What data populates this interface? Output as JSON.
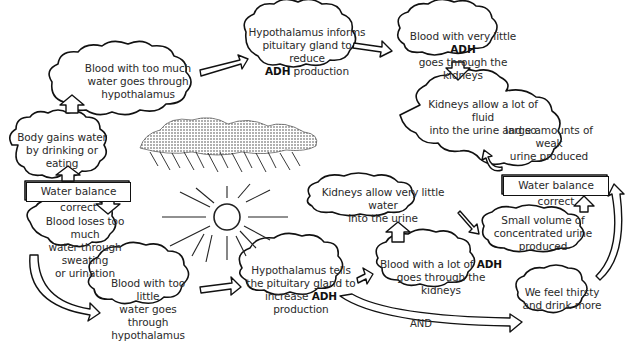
{
  "diagram": {
    "nodes": {
      "body_gains": {
        "line1": "Body gains water",
        "line2": "by drinking or eating"
      },
      "too_much_water": {
        "line1": "Blood with too much",
        "line2": "water goes through hypothalamus"
      },
      "hypo_reduce": {
        "line1": "Hypothalamus informs",
        "line2": "pituitary gland to reduce",
        "bold": "ADH",
        "line3_rest": " production"
      },
      "little_adh": {
        "line1_pre": "Blood with very little ",
        "bold": "ADH",
        "line2": "goes through the kidneys"
      },
      "kidneys_lot": {
        "line1": "Kidneys allow a lot of fluid",
        "line2": "into the urine and so",
        "line3": "large amounts of weak",
        "line4": "urine produced"
      },
      "balance_left": {
        "label": "Water balance correct"
      },
      "balance_right": {
        "label": "Water balance correct"
      },
      "blood_loses": {
        "line1": "Blood loses too much",
        "line2": "water through sweating",
        "line3": "or urination"
      },
      "too_little_water": {
        "line1": "Blood with too little",
        "line2": "water goes through",
        "line3": "hypothalamus"
      },
      "hypo_increase": {
        "line1": "Hypothalamus tells",
        "line2": "the pituitary gland to",
        "line3_pre": "increase ",
        "bold": "ADH",
        "line3_rest": " production"
      },
      "lot_adh": {
        "line1_pre": "Blood with a lot of ",
        "bold": "ADH",
        "line2": "goes through the kidneys"
      },
      "kidneys_little": {
        "line1": "Kidneys allow very little water",
        "line2": "into the urine"
      },
      "small_volume": {
        "line1": "Small volume of",
        "line2": "concentrated urine produced"
      },
      "thirsty": {
        "line1": "We feel thirsty",
        "line2": "and drink more"
      }
    },
    "connector_label": "AND",
    "illustrations": [
      "rain-cloud",
      "sun"
    ]
  }
}
